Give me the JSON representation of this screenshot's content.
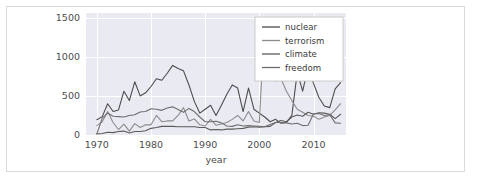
{
  "chart_data": {
    "type": "line",
    "title": "",
    "xlabel": "year",
    "ylabel": "",
    "xlim": [
      1968,
      2016
    ],
    "ylim": [
      0,
      1560
    ],
    "grid": true,
    "legend_position": "top-right",
    "xticks": [
      "1970",
      "1980",
      "1990",
      "2000",
      "2010"
    ],
    "xtick_values": [
      1970,
      1980,
      1990,
      2000,
      2010
    ],
    "yticks": [
      "0",
      "500",
      "1000",
      "1500"
    ],
    "ytick_values": [
      0,
      500,
      1000,
      1500
    ],
    "x": [
      1970,
      1971,
      1972,
      1973,
      1974,
      1975,
      1976,
      1977,
      1978,
      1979,
      1980,
      1981,
      1982,
      1983,
      1984,
      1985,
      1986,
      1987,
      1988,
      1989,
      1990,
      1991,
      1992,
      1993,
      1994,
      1995,
      1996,
      1997,
      1998,
      1999,
      2000,
      2001,
      2002,
      2003,
      2004,
      2005,
      2006,
      2007,
      2008,
      2009,
      2010,
      2011,
      2012,
      2013,
      2014,
      2015
    ],
    "series": [
      {
        "name": "nuclear",
        "color": "#4c4c4c",
        "values": [
          195,
          235,
          400,
          300,
          320,
          560,
          440,
          680,
          500,
          540,
          620,
          720,
          700,
          790,
          890,
          850,
          820,
          640,
          430,
          280,
          330,
          380,
          250,
          380,
          520,
          640,
          600,
          300,
          600,
          330,
          280,
          230,
          170,
          200,
          150,
          160,
          250,
          800,
          560,
          870,
          660,
          480,
          370,
          350,
          590,
          670
        ]
      },
      {
        "name": "terrorism",
        "color": "#8c8c8c",
        "values": [
          120,
          170,
          300,
          160,
          70,
          140,
          50,
          145,
          95,
          130,
          130,
          250,
          170,
          180,
          180,
          250,
          350,
          180,
          205,
          130,
          115,
          200,
          125,
          140,
          160,
          200,
          250,
          180,
          300,
          180,
          160,
          1500,
          930,
          690,
          720,
          560,
          440,
          330,
          290,
          250,
          240,
          200,
          230,
          250,
          320,
          400
        ]
      },
      {
        "name": "climate",
        "color": "#5a5a5a",
        "values": [
          15,
          20,
          35,
          30,
          45,
          50,
          25,
          45,
          45,
          55,
          85,
          95,
          110,
          110,
          110,
          105,
          105,
          105,
          105,
          95,
          95,
          65,
          70,
          65,
          75,
          75,
          80,
          85,
          100,
          105,
          100,
          105,
          110,
          160,
          185,
          170,
          230,
          255,
          240,
          290,
          265,
          285,
          280,
          265,
          210,
          265
        ]
      },
      {
        "name": "freedom",
        "color": "#6e6e6e",
        "values": [
          15,
          215,
          280,
          240,
          235,
          230,
          250,
          260,
          295,
          300,
          335,
          330,
          315,
          345,
          360,
          325,
          290,
          340,
          300,
          230,
          170,
          170,
          175,
          155,
          115,
          110,
          130,
          115,
          120,
          115,
          110,
          105,
          135,
          160,
          160,
          155,
          140,
          150,
          120,
          125,
          270,
          275,
          250,
          260,
          155,
          150
        ]
      }
    ]
  },
  "legend": {
    "entries": [
      {
        "label": "nuclear"
      },
      {
        "label": "terrorism"
      },
      {
        "label": "climate"
      },
      {
        "label": "freedom"
      }
    ]
  }
}
